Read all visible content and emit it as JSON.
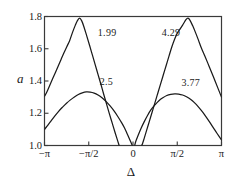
{
  "chart_data": {
    "type": "line",
    "title": "",
    "xlabel": "Δ",
    "ylabel": "a",
    "xlim": [
      -3.14159265,
      3.14159265
    ],
    "ylim": [
      1.0,
      1.8
    ],
    "grid": false,
    "legend": "inline-annotations",
    "xticks": [
      {
        "value": -3.14159265,
        "label": "−π"
      },
      {
        "value": -1.57079633,
        "label": "−π/2"
      },
      {
        "value": 0.0,
        "label": "0"
      },
      {
        "value": 1.57079633,
        "label": "π/2"
      },
      {
        "value": 3.14159265,
        "label": "π"
      }
    ],
    "yticks": [
      {
        "value": 1.0,
        "label": "1.0"
      },
      {
        "value": 1.2,
        "label": "1.2"
      },
      {
        "value": 1.4,
        "label": "1.4"
      },
      {
        "value": 1.6,
        "label": "1.6"
      },
      {
        "value": 1.8,
        "label": "1.8"
      }
    ],
    "annotations": [
      {
        "text": "1.99",
        "x": -1.25,
        "y": 1.695
      },
      {
        "text": "2.5",
        "x": -1.18,
        "y": 1.395
      },
      {
        "text": "4.29",
        "x": 1.02,
        "y": 1.695
      },
      {
        "text": "3.77",
        "x": 1.72,
        "y": 1.385
      }
    ],
    "series": [
      {
        "name": "1.99",
        "peak": {
          "x": -1.9,
          "y": 1.79
        },
        "points": [
          [
            -3.14159,
            1.305
          ],
          [
            -3.05,
            1.335
          ],
          [
            -2.95,
            1.375
          ],
          [
            -2.85,
            1.415
          ],
          [
            -2.75,
            1.455
          ],
          [
            -2.65,
            1.495
          ],
          [
            -2.55,
            1.535
          ],
          [
            -2.45,
            1.575
          ],
          [
            -2.35,
            1.613
          ],
          [
            -2.25,
            1.65
          ],
          [
            -2.15,
            1.7
          ],
          [
            -2.05,
            1.745
          ],
          [
            -1.98,
            1.772
          ],
          [
            -1.9,
            1.79
          ],
          [
            -1.82,
            1.773
          ],
          [
            -1.74,
            1.735
          ],
          [
            -1.64,
            1.678
          ],
          [
            -1.54,
            1.62
          ],
          [
            -1.44,
            1.56
          ],
          [
            -1.34,
            1.5
          ],
          [
            -1.24,
            1.44
          ],
          [
            -1.14,
            1.38
          ],
          [
            -1.04,
            1.318
          ],
          [
            -0.94,
            1.258
          ],
          [
            -0.84,
            1.198
          ],
          [
            -0.74,
            1.14
          ],
          [
            -0.64,
            1.082
          ],
          [
            -0.56,
            1.038
          ],
          [
            -0.5,
            1.005
          ],
          [
            -0.487,
            1.0
          ]
        ]
      },
      {
        "name": "2.5",
        "peak": {
          "x": -1.62,
          "y": 1.332
        },
        "points": [
          [
            -3.14159,
            1.1
          ],
          [
            -3.05,
            1.12
          ],
          [
            -2.92,
            1.15
          ],
          [
            -2.78,
            1.182
          ],
          [
            -2.64,
            1.212
          ],
          [
            -2.5,
            1.238
          ],
          [
            -2.36,
            1.262
          ],
          [
            -2.22,
            1.283
          ],
          [
            -2.08,
            1.301
          ],
          [
            -1.94,
            1.316
          ],
          [
            -1.8,
            1.326
          ],
          [
            -1.66,
            1.332
          ],
          [
            -1.52,
            1.331
          ],
          [
            -1.38,
            1.325
          ],
          [
            -1.24,
            1.313
          ],
          [
            -1.1,
            1.296
          ],
          [
            -0.96,
            1.274
          ],
          [
            -0.82,
            1.247
          ],
          [
            -0.68,
            1.216
          ],
          [
            -0.54,
            1.18
          ],
          [
            -0.4,
            1.14
          ],
          [
            -0.3,
            1.108
          ],
          [
            -0.22,
            1.078
          ],
          [
            -0.14,
            1.046
          ],
          [
            -0.07,
            1.018
          ],
          [
            -0.03,
            1.003
          ],
          [
            -0.02,
            1.0
          ]
        ]
      },
      {
        "name": "4.29",
        "peak": {
          "x": 1.95,
          "y": 1.79
        },
        "points": [
          [
            0.3,
            1.0
          ],
          [
            0.33,
            1.008
          ],
          [
            0.4,
            1.046
          ],
          [
            0.48,
            1.092
          ],
          [
            0.58,
            1.15
          ],
          [
            0.68,
            1.208
          ],
          [
            0.78,
            1.266
          ],
          [
            0.88,
            1.324
          ],
          [
            0.98,
            1.382
          ],
          [
            1.08,
            1.44
          ],
          [
            1.18,
            1.498
          ],
          [
            1.28,
            1.556
          ],
          [
            1.38,
            1.612
          ],
          [
            1.48,
            1.66
          ],
          [
            1.58,
            1.7
          ],
          [
            1.68,
            1.725
          ],
          [
            1.78,
            1.752
          ],
          [
            1.88,
            1.78
          ],
          [
            1.95,
            1.79
          ],
          [
            2.02,
            1.778
          ],
          [
            2.12,
            1.742
          ],
          [
            2.22,
            1.7
          ],
          [
            2.32,
            1.655
          ],
          [
            2.42,
            1.608
          ],
          [
            2.55,
            1.555
          ],
          [
            2.7,
            1.492
          ],
          [
            2.85,
            1.428
          ],
          [
            3.0,
            1.362
          ],
          [
            3.14159,
            1.3
          ]
        ]
      },
      {
        "name": "3.77",
        "peak": {
          "x": 1.58,
          "y": 1.32
        },
        "points": [
          [
            0.06,
            1.0
          ],
          [
            0.1,
            1.026
          ],
          [
            0.18,
            1.062
          ],
          [
            0.28,
            1.104
          ],
          [
            0.4,
            1.148
          ],
          [
            0.52,
            1.188
          ],
          [
            0.64,
            1.222
          ],
          [
            0.78,
            1.252
          ],
          [
            0.92,
            1.278
          ],
          [
            1.06,
            1.296
          ],
          [
            1.2,
            1.31
          ],
          [
            1.34,
            1.317
          ],
          [
            1.48,
            1.32
          ],
          [
            1.62,
            1.319
          ],
          [
            1.76,
            1.313
          ],
          [
            1.9,
            1.302
          ],
          [
            2.04,
            1.287
          ],
          [
            2.18,
            1.266
          ],
          [
            2.32,
            1.24
          ],
          [
            2.46,
            1.21
          ],
          [
            2.6,
            1.176
          ],
          [
            2.74,
            1.14
          ],
          [
            2.86,
            1.108
          ],
          [
            2.98,
            1.076
          ],
          [
            3.08,
            1.05
          ],
          [
            3.14159,
            1.034
          ]
        ]
      }
    ]
  },
  "style": {
    "curve_color": "#1a1a1a",
    "frame_color": "#3a3a3a",
    "background": "#ffffff"
  }
}
